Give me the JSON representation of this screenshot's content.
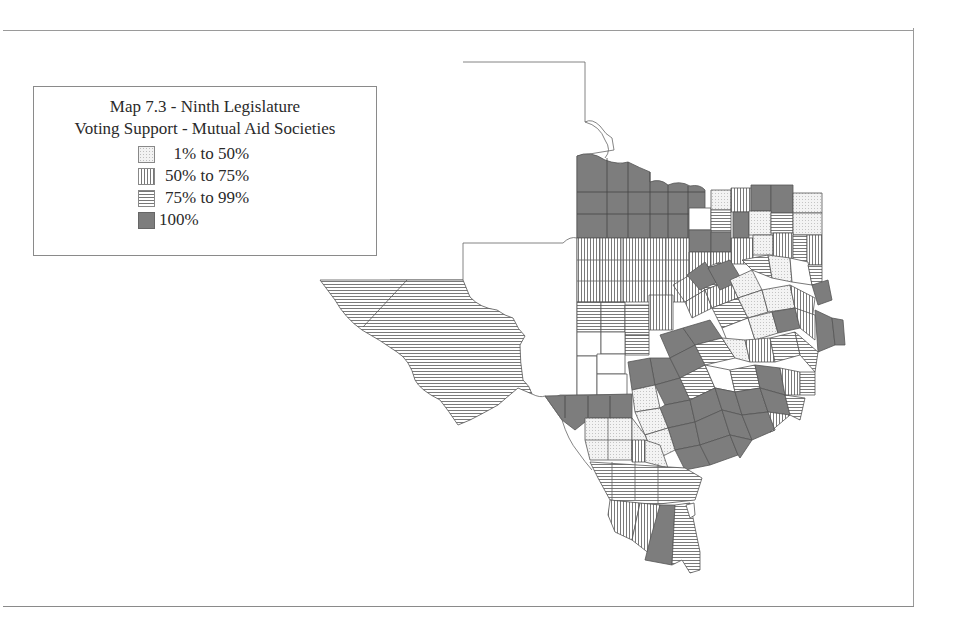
{
  "legend": {
    "title_line1": "Map 7.3 - Ninth Legislature",
    "title_line2": "Voting Support - Mutual Aid Societies",
    "items": [
      {
        "label": "  1% to 50%",
        "pattern": "stipple",
        "color": "#f2f2f2"
      },
      {
        "label": "50% to 75%",
        "pattern": "vertical-lines",
        "color": "#777777"
      },
      {
        "label": "75% to 99%",
        "pattern": "horizontal-lines",
        "color": "#777777"
      },
      {
        "label": "100%",
        "pattern": "solid",
        "color": "#7d7d7d"
      }
    ]
  },
  "map": {
    "region": "Texas counties",
    "stroke_color": "#555555",
    "solid_fill": "#7d7d7d"
  }
}
